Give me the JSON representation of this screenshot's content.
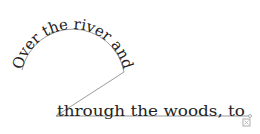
{
  "canvas": {
    "text_segments": [
      {
        "id": "arc",
        "text": "Over the river and"
      },
      {
        "id": "line",
        "text": "through the woods, to"
      }
    ],
    "path_color": "#9a9a9a",
    "text_color": "#222222",
    "overflow_indicator": "overflow-plus-icon"
  }
}
